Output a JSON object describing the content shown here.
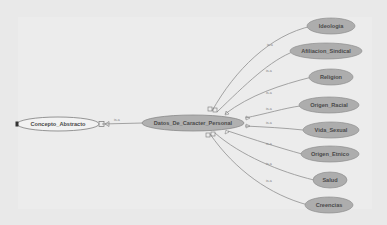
{
  "diagram": {
    "type": "ontology-graph",
    "root": {
      "label": "Concepto_Abstracto",
      "fill": "#f2f2f2",
      "stroke": "#8a8a8a"
    },
    "center": {
      "label": "Datos_De_Caracter_Personal",
      "fill": "#b0b0b0",
      "stroke": "#8a8a8a"
    },
    "root_edge_label": "is-a",
    "children": [
      {
        "label": "Ideologia",
        "edge_label": "is-a"
      },
      {
        "label": "Afiliacion_Sindical",
        "edge_label": "is-a"
      },
      {
        "label": "Religion",
        "edge_label": "is-a"
      },
      {
        "label": "Origen_Racial",
        "edge_label": "is-a"
      },
      {
        "label": "Vida_Sexual",
        "edge_label": "is-a"
      },
      {
        "label": "Origen_Etnico",
        "edge_label": "is-a"
      },
      {
        "label": "Salud",
        "edge_label": "is-a"
      },
      {
        "label": "Creencias",
        "edge_label": "is-a"
      }
    ],
    "child_fill": "#adadad",
    "edge_color": "#8f8f8f"
  }
}
